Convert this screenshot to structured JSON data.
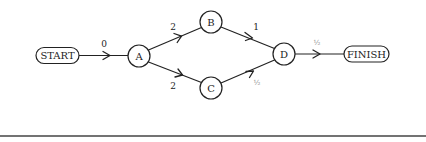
{
  "diagram": {
    "type": "activity-network",
    "nodes": {
      "start": {
        "label": "START",
        "shape": "pill"
      },
      "a": {
        "label": "A",
        "shape": "circle"
      },
      "b": {
        "label": "B",
        "shape": "circle"
      },
      "c": {
        "label": "C",
        "shape": "circle"
      },
      "d": {
        "label": "D",
        "shape": "circle"
      },
      "finish": {
        "label": "FINISH",
        "shape": "pill"
      }
    },
    "edges": {
      "start_a": {
        "from": "START",
        "to": "A",
        "weight": "0"
      },
      "a_b": {
        "from": "A",
        "to": "B",
        "weight": "2"
      },
      "a_c": {
        "from": "A",
        "to": "C",
        "weight": "2"
      },
      "b_d": {
        "from": "B",
        "to": "D",
        "weight": "1"
      },
      "c_d": {
        "from": "C",
        "to": "D",
        "weight": "½"
      },
      "d_finish": {
        "from": "D",
        "to": "FINISH",
        "weight": "½"
      }
    },
    "colors": {
      "stroke": "#222222",
      "background": "#ffffff",
      "fraction_text": "#888888",
      "rule": "#444444"
    }
  }
}
